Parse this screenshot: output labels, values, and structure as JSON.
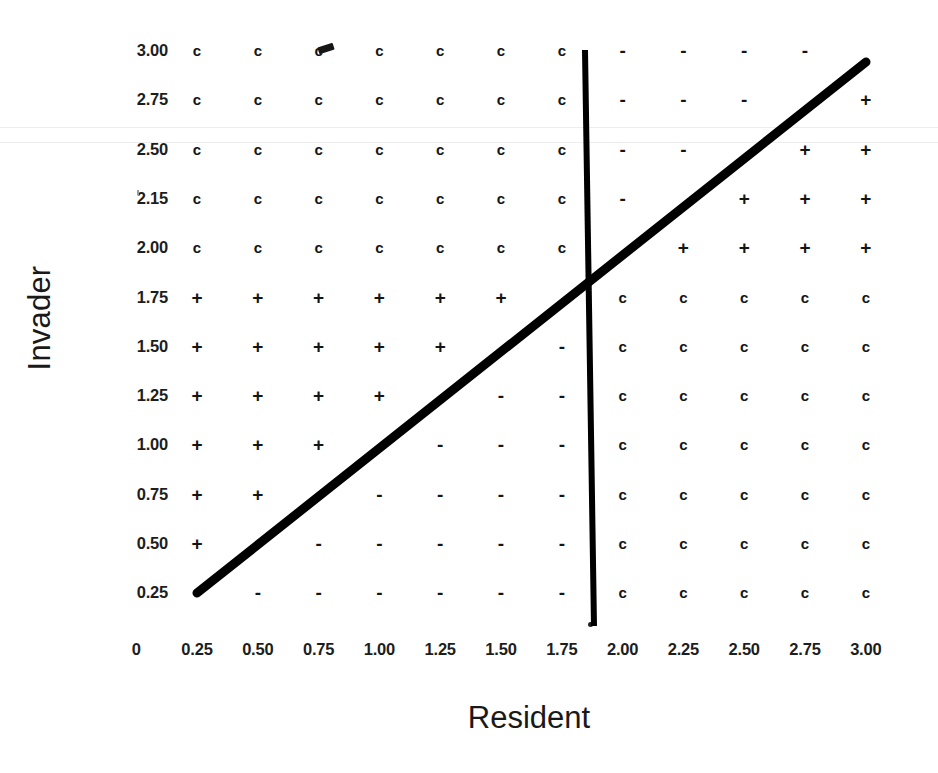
{
  "figure": {
    "x_axis_title": "Resident",
    "y_axis_title": "Invader"
  },
  "chart_data": {
    "type": "heatmap",
    "title": "",
    "xlabel": "Resident",
    "ylabel": "Invader",
    "grid": false,
    "legend": "none",
    "x_tick_labels": [
      "0",
      "0.25",
      "0.50",
      "0.75",
      "1.00",
      "1.25",
      "1.50",
      "1.75",
      "2.00",
      "2.25",
      "2.50",
      "2.75",
      "3.00"
    ],
    "y_tick_labels": [
      "3.00",
      "2.75",
      "2.50",
      "2.15",
      "2.00",
      "1.75",
      "1.50",
      "1.25",
      "1.00",
      "0.75",
      "0.50",
      "0.25"
    ],
    "x_categories": [
      "0.25",
      "0.50",
      "0.75",
      "1.00",
      "1.25",
      "1.50",
      "1.75",
      "2.00",
      "2.25",
      "2.50",
      "2.75",
      "3.00"
    ],
    "y_categories": [
      "3.00",
      "2.75",
      "2.50",
      "2.15",
      "2.00",
      "1.75",
      "1.50",
      "1.25",
      "1.00",
      "0.75",
      "0.50",
      "0.25"
    ],
    "symbols": {
      "c": "c",
      "plus": "+",
      "minus": "-",
      "blank": ""
    },
    "cells": [
      [
        "c",
        "c",
        "c",
        "c",
        "c",
        "c",
        "c",
        "-",
        "-",
        "-",
        "-",
        ""
      ],
      [
        "c",
        "c",
        "c",
        "c",
        "c",
        "c",
        "c",
        "-",
        "-",
        "-",
        "",
        "+"
      ],
      [
        "c",
        "c",
        "c",
        "c",
        "c",
        "c",
        "c",
        "-",
        "-",
        "",
        "+",
        "+"
      ],
      [
        "c",
        "c",
        "c",
        "c",
        "c",
        "c",
        "c",
        "-",
        "",
        "+",
        "+",
        "+"
      ],
      [
        "c",
        "c",
        "c",
        "c",
        "c",
        "c",
        "c",
        "",
        "+",
        "+",
        "+",
        "+"
      ],
      [
        "+",
        "+",
        "+",
        "+",
        "+",
        "+",
        "",
        "c",
        "c",
        "c",
        "c",
        "c"
      ],
      [
        "+",
        "+",
        "+",
        "+",
        "+",
        "",
        "-",
        "c",
        "c",
        "c",
        "c",
        "c"
      ],
      [
        "+",
        "+",
        "+",
        "+",
        "",
        "-",
        "-",
        "c",
        "c",
        "c",
        "c",
        "c"
      ],
      [
        "+",
        "+",
        "+",
        "",
        "-",
        "-",
        "-",
        "c",
        "c",
        "c",
        "c",
        "c"
      ],
      [
        "+",
        "+",
        "",
        "-",
        "-",
        "-",
        "-",
        "c",
        "c",
        "c",
        "c",
        "c"
      ],
      [
        "+",
        "",
        "-",
        "-",
        "-",
        "-",
        "-",
        "c",
        "c",
        "c",
        "c",
        "c"
      ],
      [
        "",
        "-",
        "-",
        "-",
        "-",
        "-",
        "-",
        "c",
        "c",
        "c",
        "c",
        "c"
      ]
    ],
    "annotations": [
      {
        "name": "diagonal-isocline",
        "description": "thick black diagonal line from (0.25, 0.25) to (3.00, 3.00)",
        "x0": 0.25,
        "y0": 0.25,
        "x1": 3.0,
        "y1": 3.0,
        "color": "#000000"
      },
      {
        "name": "vertical-isocline",
        "description": "thick black near-vertical line at Resident = 1.87",
        "x0": 1.88,
        "y0": 3.05,
        "x1": 1.86,
        "y1": 0.12,
        "color": "#000000"
      }
    ]
  }
}
